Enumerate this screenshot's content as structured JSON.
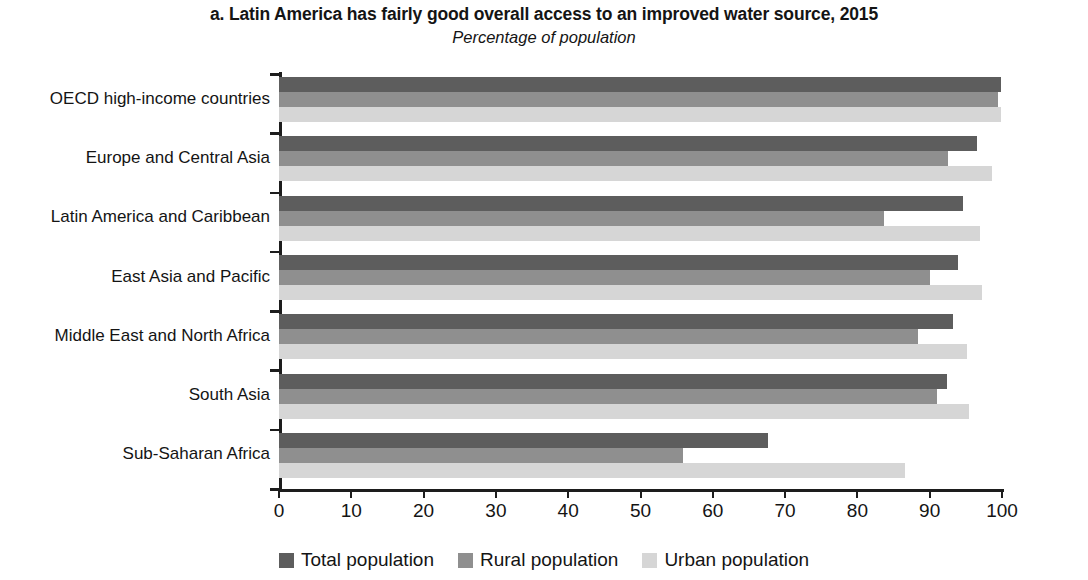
{
  "chart_data": {
    "type": "bar",
    "orientation": "horizontal",
    "title": "a. Latin America has fairly good overall access to an improved water source, 2015",
    "subtitle": "Percentage of population",
    "xlabel": "",
    "ylabel": "",
    "xlim": [
      0,
      100
    ],
    "xticks": [
      "0",
      "10",
      "20",
      "30",
      "40",
      "50",
      "60",
      "70",
      "80",
      "90",
      "100"
    ],
    "grid": false,
    "legend_position": "bottom",
    "categories": [
      "OECD high-income countries",
      "Europe and Central Asia",
      "Latin America and Caribbean",
      "East Asia and Pacific",
      "Middle East and North Africa",
      "South Asia",
      "Sub-Saharan Africa"
    ],
    "series": [
      {
        "name": "Total population",
        "color": "#5d5d5d",
        "values": [
          99.8,
          96.6,
          94.6,
          93.9,
          93.2,
          92.4,
          67.6
        ]
      },
      {
        "name": "Rural population",
        "color": "#8f8f8f",
        "values": [
          99.5,
          92.5,
          83.7,
          90.0,
          88.4,
          91.0,
          55.9
        ]
      },
      {
        "name": "Urban population",
        "color": "#d6d6d6",
        "values": [
          99.9,
          98.6,
          96.9,
          97.2,
          95.2,
          95.5,
          86.6
        ]
      }
    ]
  },
  "legend": {
    "items": [
      {
        "label": "Total population",
        "swatch": "#5d5d5d"
      },
      {
        "label": "Rural population",
        "swatch": "#8f8f8f"
      },
      {
        "label": "Urban population",
        "swatch": "#d6d6d6"
      }
    ]
  }
}
